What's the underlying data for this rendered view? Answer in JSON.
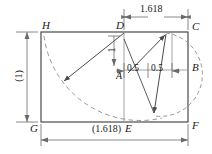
{
  "diagram": {
    "colors": {
      "solid_line": "#4a4a4a",
      "dashed_line": "#8a8a8a",
      "dimension_line": "#6a6a6a",
      "text": "#1a1a1a",
      "background": "#ffffff"
    },
    "vertex_labels": {
      "H": "H",
      "D": "D",
      "C": "C",
      "A": "A",
      "B": "B",
      "G": "G",
      "E": "E",
      "F": "F"
    },
    "dimensions": {
      "top_width": "1.618",
      "left_height": "(1)",
      "bottom_width": "(1.618)",
      "vertical_one": "1",
      "half_left": "0.5",
      "half_right": "0.5"
    }
  },
  "geometry": {
    "rect": {
      "left": 41,
      "top": 32,
      "right": 188,
      "bottom": 122
    },
    "points": {
      "H": [
        41,
        32
      ],
      "D": [
        124,
        32
      ],
      "C": [
        188,
        32
      ],
      "A": [
        124,
        70
      ],
      "B": [
        188,
        70
      ],
      "G": [
        41,
        122
      ],
      "E": [
        124,
        122
      ],
      "F": [
        188,
        122
      ],
      "arcL": [
        62,
        82
      ],
      "arcTopRight": [
        166,
        33
      ],
      "arcBotRight": [
        155,
        115
      ],
      "mid": [
        172,
        70
      ]
    }
  }
}
